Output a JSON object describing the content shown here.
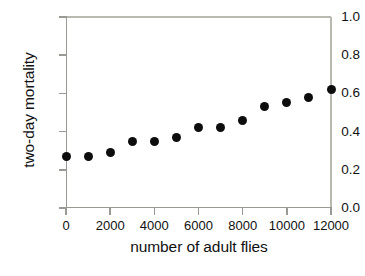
{
  "chart_data": {
    "type": "scatter",
    "title": "",
    "xlabel": "number of adult flies",
    "ylabel": "two-day mortality",
    "xlim": [
      0,
      12000
    ],
    "ylim": [
      0.0,
      1.0
    ],
    "grid": false,
    "legend": null,
    "marker": "filled-circle",
    "marker_color": "#0d0d0d",
    "axis_color": "#9a9a94",
    "background": "#ffffff",
    "xticks": [
      0,
      2000,
      4000,
      6000,
      8000,
      10000,
      12000
    ],
    "xticklabels": [
      "0",
      "2000",
      "4000",
      "6000",
      "8000",
      "10000",
      "12000"
    ],
    "yticks": [
      0.0,
      0.2,
      0.4,
      0.6,
      0.8,
      1.0
    ],
    "yticklabels": [
      "0.0",
      "0.2",
      "0.4",
      "0.6",
      "0.8",
      "1.0"
    ],
    "x": [
      0,
      1000,
      2000,
      3000,
      4000,
      5000,
      6000,
      7000,
      8000,
      9000,
      10000,
      11000,
      12000
    ],
    "y": [
      0.27,
      0.27,
      0.29,
      0.35,
      0.35,
      0.37,
      0.42,
      0.42,
      0.46,
      0.53,
      0.55,
      0.58,
      0.62
    ],
    "points": [
      {
        "x": 0,
        "y": 0.27
      },
      {
        "x": 1000,
        "y": 0.27
      },
      {
        "x": 2000,
        "y": 0.29
      },
      {
        "x": 3000,
        "y": 0.35
      },
      {
        "x": 4000,
        "y": 0.35
      },
      {
        "x": 5000,
        "y": 0.37
      },
      {
        "x": 6000,
        "y": 0.42
      },
      {
        "x": 7000,
        "y": 0.42
      },
      {
        "x": 8000,
        "y": 0.46
      },
      {
        "x": 9000,
        "y": 0.53
      },
      {
        "x": 10000,
        "y": 0.55
      },
      {
        "x": 11000,
        "y": 0.58
      },
      {
        "x": 12000,
        "y": 0.62
      }
    ]
  },
  "caption": ""
}
